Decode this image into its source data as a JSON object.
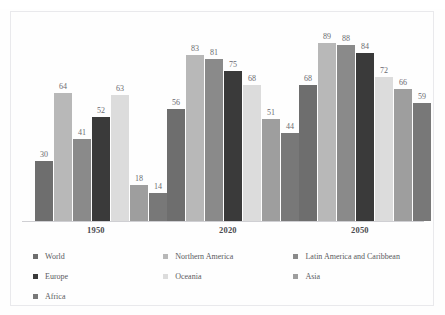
{
  "chart_data": {
    "type": "bar",
    "title": "",
    "subtitle": "",
    "xlabel": "",
    "ylabel": "",
    "ylim": [
      0,
      100
    ],
    "grid": false,
    "legend_position": "bottom",
    "categories": [
      "1950",
      "2020",
      "2050"
    ],
    "series": [
      {
        "name": "World",
        "color": "#6e6e6e",
        "values": [
          30,
          56,
          68
        ]
      },
      {
        "name": "Northern America",
        "color": "#b8b8b8",
        "values": [
          64,
          83,
          89
        ]
      },
      {
        "name": "Latin America and Caribbean",
        "color": "#8a8a8a",
        "values": [
          41,
          81,
          88
        ]
      },
      {
        "name": "Europe",
        "color": "#3a3a3a",
        "values": [
          52,
          75,
          84
        ]
      },
      {
        "name": "Oceania",
        "color": "#dcdcdc",
        "values": [
          63,
          68,
          72
        ]
      },
      {
        "name": "Asia",
        "color": "#9e9e9e",
        "values": [
          18,
          51,
          66
        ]
      },
      {
        "name": "Africa",
        "color": "#787878",
        "values": [
          14,
          44,
          59
        ]
      }
    ]
  },
  "axis": {
    "tick_labels": [
      "1950",
      "2020",
      "2050"
    ]
  },
  "legend": {
    "entries": [
      {
        "label": "World",
        "color": "#6e6e6e"
      },
      {
        "label": "Northern America",
        "color": "#b8b8b8"
      },
      {
        "label": "Latin America and Caribbean",
        "color": "#8a8a8a"
      },
      {
        "label": "Europe",
        "color": "#3a3a3a"
      },
      {
        "label": "Oceania",
        "color": "#dcdcdc"
      },
      {
        "label": "Asia",
        "color": "#9e9e9e"
      },
      {
        "label": "Africa",
        "color": "#787878"
      }
    ]
  }
}
